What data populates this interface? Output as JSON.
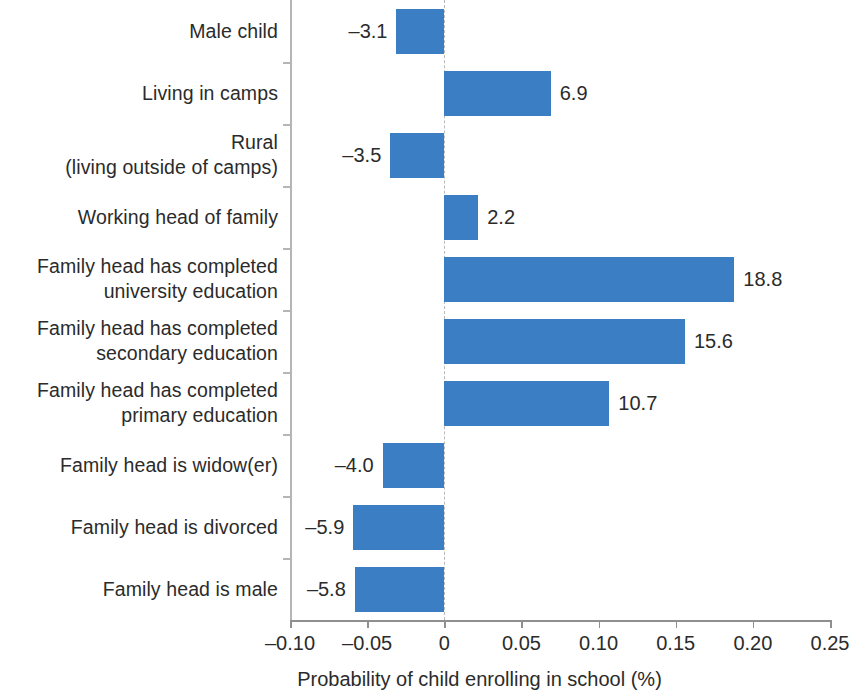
{
  "chart_data": {
    "type": "bar",
    "orientation": "horizontal",
    "title": "",
    "xlabel": "Probability of child enrolling in school (%)",
    "ylabel": "",
    "xlim": [
      -0.1,
      0.25
    ],
    "xticks": [
      -0.1,
      -0.05,
      0,
      0.05,
      0.1,
      0.15,
      0.2,
      0.25
    ],
    "xtick_labels": [
      "–0.10",
      "–0.05",
      "0",
      "0.05",
      "0.10",
      "0.15",
      "0.20",
      "0.25"
    ],
    "grid": false,
    "legend": null,
    "zero_reference_line": true,
    "bar_color": "#3b7ec4",
    "value_label_scale_note": "data labels are the axis value multiplied by 100",
    "categories": [
      "Male child",
      "Living in camps",
      "Rural\n(living outside of camps)",
      "Working head of family",
      "Family head has completed\nuniversity education",
      "Family head has completed\nsecondary education",
      "Family head has completed\nprimary education",
      "Family head is widow(er)",
      "Family head is divorced",
      "Family head is male"
    ],
    "values": [
      -0.031,
      0.069,
      -0.035,
      0.022,
      0.188,
      0.156,
      0.107,
      -0.04,
      -0.059,
      -0.058
    ],
    "value_labels": [
      "–3.1",
      "6.9",
      "–3.5",
      "2.2",
      "18.8",
      "15.6",
      "10.7",
      "–4.0",
      "–5.9",
      "–5.8"
    ]
  }
}
